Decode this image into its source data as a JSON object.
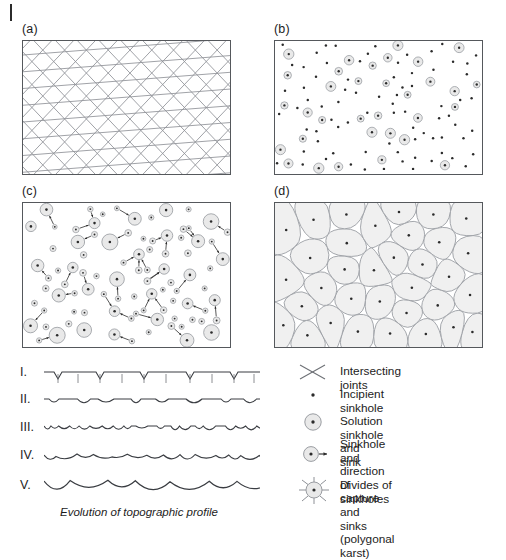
{
  "figure": {
    "panels": [
      {
        "id": "a",
        "label": "(a)",
        "type": "intersecting-joints",
        "x": 22,
        "y": 40,
        "w": 209,
        "h": 135
      },
      {
        "id": "b",
        "label": "(b)",
        "type": "incipient-sinkholes",
        "x": 274,
        "y": 40,
        "w": 209,
        "h": 135
      },
      {
        "id": "c",
        "label": "(c)",
        "type": "sinkhole-capture",
        "x": 22,
        "y": 202,
        "w": 209,
        "h": 146
      },
      {
        "id": "d",
        "label": "(d)",
        "type": "polygonal-karst",
        "x": 274,
        "y": 202,
        "w": 209,
        "h": 146
      }
    ],
    "profiles": {
      "caption": "Evolution of topographic profile",
      "stages": [
        {
          "label": "I.",
          "stage": 1
        },
        {
          "label": "II.",
          "stage": 2
        },
        {
          "label": "III.",
          "stage": 3
        },
        {
          "label": "IV.",
          "stage": 4
        },
        {
          "label": "V.",
          "stage": 5
        }
      ]
    },
    "legend": {
      "items": [
        {
          "symbol": "intersecting-joints-icon",
          "label": "Intersecting joints"
        },
        {
          "symbol": "incipient-sinkhole-icon",
          "label": "Incipient sinkhole"
        },
        {
          "symbol": "solution-sinkhole-icon",
          "label": "Solution sinkhole and sink"
        },
        {
          "symbol": "sinkhole-capture-icon",
          "label": "Sinkhole and\ndirection of capture"
        },
        {
          "symbol": "polygonal-karst-icon",
          "label": "Divides of sinkholes and\nsinks (polygonal karst)"
        }
      ]
    },
    "colors": {
      "line": "#55585c",
      "joint_line": "#8d9096",
      "sinkhole_fill": "#e9e9e9",
      "sinkhole_stroke": "#9a9da2",
      "polygon_fill": "#f0f0f0",
      "dot": "#2b2b2b",
      "text": "#1c1c1c",
      "background": "#ffffff"
    }
  }
}
